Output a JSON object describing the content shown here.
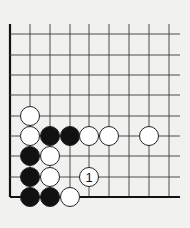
{
  "diagram": {
    "type": "go-board-corner",
    "background": "#f1f1ef",
    "line_color": "#3a3a3a",
    "edge_color": "#111111",
    "grid": {
      "columns_x": [
        10,
        30,
        50,
        70,
        89,
        109,
        129,
        149,
        169
      ],
      "rows_y": [
        34,
        55,
        75,
        95,
        116,
        136,
        156,
        177,
        197
      ],
      "top_extend_y": 24,
      "right_extend_x": 180,
      "left_edge": true,
      "bottom_edge": true
    },
    "stone_radius": 9.5,
    "stones": [
      {
        "color": "white",
        "col": 1,
        "row": 4
      },
      {
        "color": "white",
        "col": 1,
        "row": 5
      },
      {
        "color": "black",
        "col": 2,
        "row": 5
      },
      {
        "color": "black",
        "col": 3,
        "row": 5
      },
      {
        "color": "white",
        "col": 4,
        "row": 5
      },
      {
        "color": "white",
        "col": 5,
        "row": 5
      },
      {
        "color": "white",
        "col": 7,
        "row": 5
      },
      {
        "color": "black",
        "col": 1,
        "row": 6
      },
      {
        "color": "white",
        "col": 2,
        "row": 6
      },
      {
        "color": "black",
        "col": 1,
        "row": 7
      },
      {
        "color": "white",
        "col": 2,
        "row": 7
      },
      {
        "color": "white",
        "col": 4,
        "row": 7,
        "label": "1"
      },
      {
        "color": "black",
        "col": 1,
        "row": 8
      },
      {
        "color": "black",
        "col": 2,
        "row": 8
      },
      {
        "color": "white",
        "col": 3,
        "row": 8
      }
    ]
  }
}
